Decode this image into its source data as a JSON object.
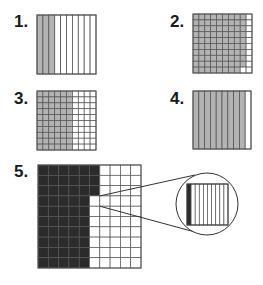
{
  "colors": {
    "shade": "#b3b3b3",
    "dark": "#2b2b2b",
    "line": "#555555",
    "white": "#ffffff"
  },
  "problems": [
    {
      "label": "1.",
      "type": "columns",
      "divisions": 10,
      "shaded": 3
    },
    {
      "label": "2.",
      "type": "hundred_grid",
      "rows": 10,
      "cols": 10,
      "shaded": 89,
      "unshaded_cells": "entire last column plus second-to-last cell of bottom row"
    },
    {
      "label": "3.",
      "type": "hundred_grid",
      "rows": 10,
      "cols": 10,
      "shaded_columns": 6,
      "shaded": 60
    },
    {
      "label": "4.",
      "type": "columns",
      "divisions": 10,
      "shaded": 9
    },
    {
      "label": "5.",
      "type": "hundred_grid_magnified",
      "rows": 10,
      "cols": 10,
      "dark_full_columns": 5,
      "dark_extra_cells_col6": 3,
      "magnified_cell": {
        "row": 4,
        "col": 6,
        "divisions": 10,
        "shaded": 1
      }
    }
  ]
}
